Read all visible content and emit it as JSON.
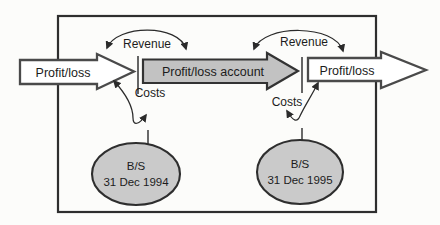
{
  "figure": {
    "left_flow": {
      "label": "Profit/loss"
    },
    "account": {
      "label": "Profit/loss account"
    },
    "right_flow": {
      "label": "Profit/loss"
    },
    "period_1994": {
      "revenue_label": "Revenue",
      "costs_label": "Costs",
      "balance_sheet": {
        "title": "B/S",
        "date": "31 Dec 1994"
      }
    },
    "period_1995": {
      "revenue_label": "Revenue",
      "costs_label": "Costs",
      "balance_sheet": {
        "title": "B/S",
        "date": "31 Dec 1995"
      }
    },
    "colors": {
      "account_arrow_fill": "#c2c2c2",
      "balance_sheet_fill": "#cacaca",
      "outline": "#3c3c3c"
    }
  }
}
